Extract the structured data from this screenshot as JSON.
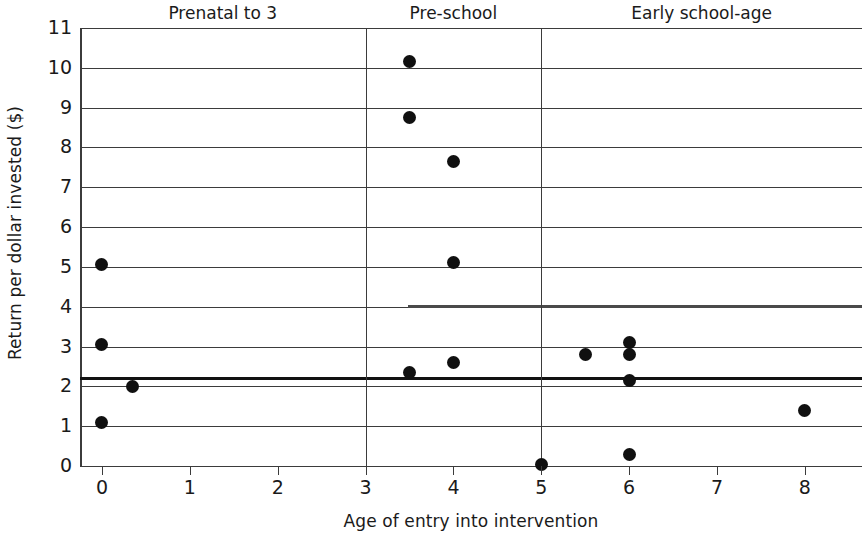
{
  "chart_data": {
    "type": "scatter",
    "title": "",
    "xlabel": "Age of entry into intervention",
    "ylabel": "Return per dollar invested ($)",
    "xlim": [
      -0.25,
      8.65
    ],
    "ylim": [
      0,
      11
    ],
    "xticks": [
      "0",
      "1",
      "2",
      "3",
      "4",
      "5",
      "6",
      "7",
      "8"
    ],
    "xtick_values": [
      0,
      1,
      2,
      3,
      4,
      5,
      6,
      7,
      8
    ],
    "yticks": [
      "0",
      "1",
      "2",
      "3",
      "4",
      "5",
      "6",
      "7",
      "8",
      "9",
      "10",
      "11"
    ],
    "ytick_values": [
      0,
      1,
      2,
      3,
      4,
      5,
      6,
      7,
      8,
      9,
      10,
      11
    ],
    "grid": "horizontal",
    "legend": "none",
    "points": [
      {
        "x": 0.0,
        "y": 5.05
      },
      {
        "x": 0.0,
        "y": 3.05
      },
      {
        "x": 0.0,
        "y": 1.1
      },
      {
        "x": 0.35,
        "y": 2.0
      },
      {
        "x": 3.5,
        "y": 10.15
      },
      {
        "x": 3.5,
        "y": 8.75
      },
      {
        "x": 3.5,
        "y": 2.35
      },
      {
        "x": 4.0,
        "y": 7.65
      },
      {
        "x": 4.0,
        "y": 5.1
      },
      {
        "x": 4.0,
        "y": 2.6
      },
      {
        "x": 5.0,
        "y": 0.05
      },
      {
        "x": 5.5,
        "y": 2.8
      },
      {
        "x": 6.0,
        "y": 3.1
      },
      {
        "x": 6.0,
        "y": 2.8
      },
      {
        "x": 6.0,
        "y": 2.15
      },
      {
        "x": 6.0,
        "y": 0.3
      },
      {
        "x": 8.0,
        "y": 1.4
      }
    ],
    "reference_lines": [
      {
        "y": 2.2,
        "style": "thick"
      },
      {
        "y": 4.0,
        "style": "thick-partial"
      }
    ],
    "dividers": [
      {
        "x": 3.0
      },
      {
        "x": 5.0
      }
    ],
    "sections": [
      {
        "label": "Prenatal to 3",
        "x_start": -0.25,
        "x_end": 3.0
      },
      {
        "label": "Pre-school",
        "x_start": 3.0,
        "x_end": 5.0
      },
      {
        "label": "Early school-age",
        "x_start": 5.0,
        "x_end": 8.65
      }
    ],
    "colors": {
      "marker": "#101010",
      "gridline": "#3b3b3b",
      "reference": "#121212",
      "background": "#ffffff",
      "text": "#1a1a1a"
    }
  }
}
